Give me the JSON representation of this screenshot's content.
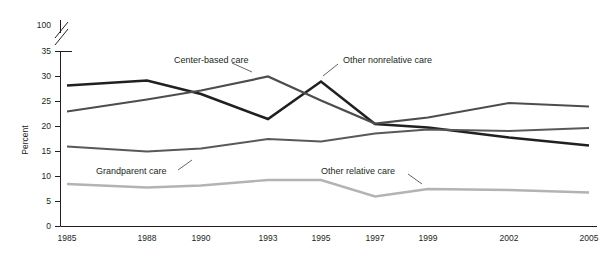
{
  "chart_data": {
    "type": "line",
    "title": "",
    "subtitle": "",
    "xlabel": "",
    "ylabel": "Percent",
    "x": [
      "1985",
      "1988",
      "1990",
      "1993",
      "1995",
      "1997",
      "1999",
      "2002",
      "2005"
    ],
    "xtick_labels": [
      "1985",
      "1988",
      "1990",
      "1993",
      "1995",
      "1997",
      "1999",
      "2002",
      "2005"
    ],
    "ytick_labels": [
      "0",
      "5",
      "10",
      "15",
      "20",
      "25",
      "30",
      "35",
      "100"
    ],
    "ytick_values": [
      0,
      5,
      10,
      15,
      20,
      25,
      30,
      35,
      100
    ],
    "ylim": [
      0,
      37
    ],
    "axis_break": {
      "between": [
        35,
        100
      ],
      "style": "double-slash"
    },
    "grid": false,
    "legend": "inline-annotations",
    "series": [
      {
        "name": "Other nonrelative care",
        "color": "#231f20",
        "values": [
          28.2,
          29.2,
          26.5,
          21.5,
          29.0,
          20.5,
          19.8,
          17.8,
          16.2
        ]
      },
      {
        "name": "Center-based care",
        "color": "#4d4d4d",
        "values": [
          23.0,
          25.4,
          27.2,
          30.0,
          25.2,
          20.6,
          21.8,
          24.7,
          24.0
        ]
      },
      {
        "name": "Grandparent care",
        "color": "#595959",
        "values": [
          16.0,
          15.0,
          15.6,
          17.5,
          17.0,
          18.6,
          19.4,
          19.1,
          19.7
        ]
      },
      {
        "name": "Other relative care",
        "color": "#b3b3b3",
        "values": [
          8.5,
          7.8,
          8.2,
          9.3,
          9.3,
          6.0,
          7.5,
          7.3,
          6.8
        ]
      }
    ],
    "annotations": [
      {
        "text": "Center-based care",
        "series": "Center-based care"
      },
      {
        "text": "Other nonrelative care",
        "series": "Other nonrelative care"
      },
      {
        "text": "Grandparent care",
        "series": "Grandparent care"
      },
      {
        "text": "Other relative care",
        "series": "Other relative care"
      }
    ]
  }
}
